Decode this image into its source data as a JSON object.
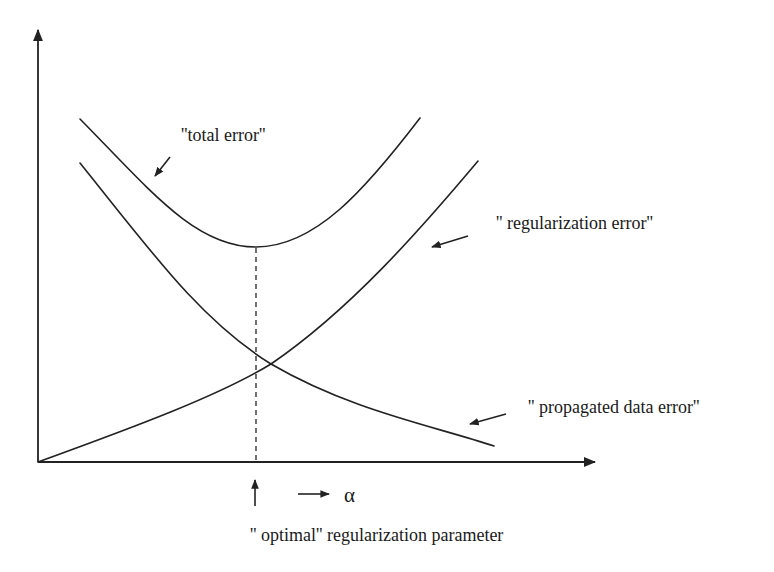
{
  "diagram": {
    "type": "conceptual-error-curves",
    "axes": {
      "origin": [
        38,
        462
      ],
      "y_axis_top": [
        38,
        26
      ],
      "x_axis_right": [
        597,
        462
      ],
      "xlabel_symbol": "α",
      "ylabel": ""
    },
    "curves": [
      {
        "id": "total-error",
        "label": "''total error''",
        "shape": "U-shaped, minimum at optimal parameter",
        "points": [
          [
            80,
            119
          ],
          [
            150,
            185
          ],
          [
            210,
            235
          ],
          [
            256,
            247
          ],
          [
            300,
            237
          ],
          [
            370,
            180
          ],
          [
            420,
            118
          ]
        ]
      },
      {
        "id": "regularization-error",
        "label": "'' regularization error''",
        "shape": "increasing from origin",
        "points": [
          [
            38,
            462
          ],
          [
            150,
            420
          ],
          [
            256,
            372
          ],
          [
            300,
            343
          ],
          [
            400,
            250
          ],
          [
            440,
            205
          ],
          [
            478,
            161
          ]
        ]
      },
      {
        "id": "propagated-data-error",
        "label": "'' propagated data error''",
        "shape": "decreasing",
        "points": [
          [
            80,
            163
          ],
          [
            180,
            290
          ],
          [
            250,
            352
          ],
          [
            271,
            364
          ],
          [
            380,
            415
          ],
          [
            494,
            446
          ]
        ]
      }
    ],
    "optimal": {
      "x": 256,
      "min_y": 247,
      "crossing_point": [
        271,
        364
      ],
      "annotation": "'' optimal'' regularization parameter"
    },
    "labels": {
      "total_error": "''total error''",
      "regularization_error": "'' regularization error''",
      "propagated_data_error": "'' propagated data error''",
      "alpha": "α",
      "optimal_parameter": "'' optimal'' regularization parameter"
    },
    "colors": {
      "ink": "#222222",
      "background": "#ffffff"
    }
  }
}
